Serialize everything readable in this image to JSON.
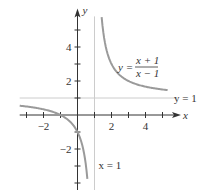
{
  "chart_data": {
    "type": "line",
    "title": "",
    "xlabel": "x",
    "ylabel": "y",
    "xlim": [
      -3.4,
      5.5
    ],
    "ylim": [
      -4.5,
      5.8
    ],
    "x_ticks": [
      -3,
      -2,
      -1,
      1,
      2,
      3,
      4,
      5
    ],
    "x_tick_labels": [
      {
        "value": -2,
        "label": "−2"
      },
      {
        "value": 2,
        "label": "2"
      },
      {
        "value": 4,
        "label": "4"
      }
    ],
    "y_ticks": [
      -4,
      -3,
      -2,
      -1,
      1,
      2,
      3,
      4,
      5
    ],
    "y_tick_labels": [
      {
        "value": -2,
        "label": "−2"
      },
      {
        "value": 2,
        "label": "2"
      },
      {
        "value": 4,
        "label": "4"
      }
    ],
    "grid": false,
    "series": [
      {
        "name": "y = (x+1)/(x-1)",
        "function": "(x+1)/(x-1)",
        "branches": [
          [
            -3.4,
            0.58
          ],
          [
            1.42,
            5.3
          ]
        ]
      }
    ],
    "asymptotes": [
      {
        "type": "horizontal",
        "value": 1,
        "label": "y = 1"
      },
      {
        "type": "vertical",
        "value": 1,
        "label": "x = 1"
      }
    ],
    "equation_label": {
      "lhs": "y =",
      "numerator": "x + 1",
      "denominator": "x − 1"
    },
    "colors": {
      "curve": "#9a9a9a",
      "axes": "#333333",
      "asymptote": "#cccccc"
    }
  }
}
